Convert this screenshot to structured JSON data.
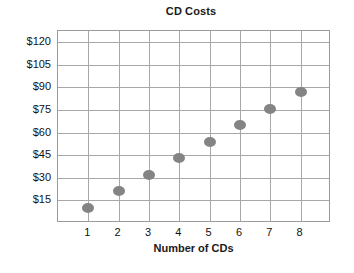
{
  "chart_data": {
    "type": "scatter",
    "title": "CD Costs",
    "xlabel": "Number of CDs",
    "ylabel": "",
    "x": [
      1,
      2,
      3,
      4,
      5,
      6,
      7,
      8
    ],
    "values": [
      10,
      21,
      32,
      43,
      54,
      65,
      76,
      87
    ],
    "categories": [
      "1",
      "2",
      "3",
      "4",
      "5",
      "6",
      "7",
      "8"
    ],
    "xtick_labels": [
      "1",
      "2",
      "3",
      "4",
      "5",
      "6",
      "7",
      "8"
    ],
    "ytick_labels": [
      "$15",
      "$30",
      "$45",
      "$60",
      "$75",
      "$90",
      "$105",
      "$120"
    ],
    "ytick_values": [
      15,
      30,
      45,
      60,
      75,
      90,
      105,
      120
    ],
    "xlim": [
      0,
      9
    ],
    "ylim": [
      0,
      127.5
    ],
    "grid": true,
    "legend": null,
    "marker_color": "#848484",
    "grid_color": "#a8a8a8",
    "axis_color": "#9a9a9a",
    "background": "#ffffff",
    "text_color": "#111111"
  }
}
